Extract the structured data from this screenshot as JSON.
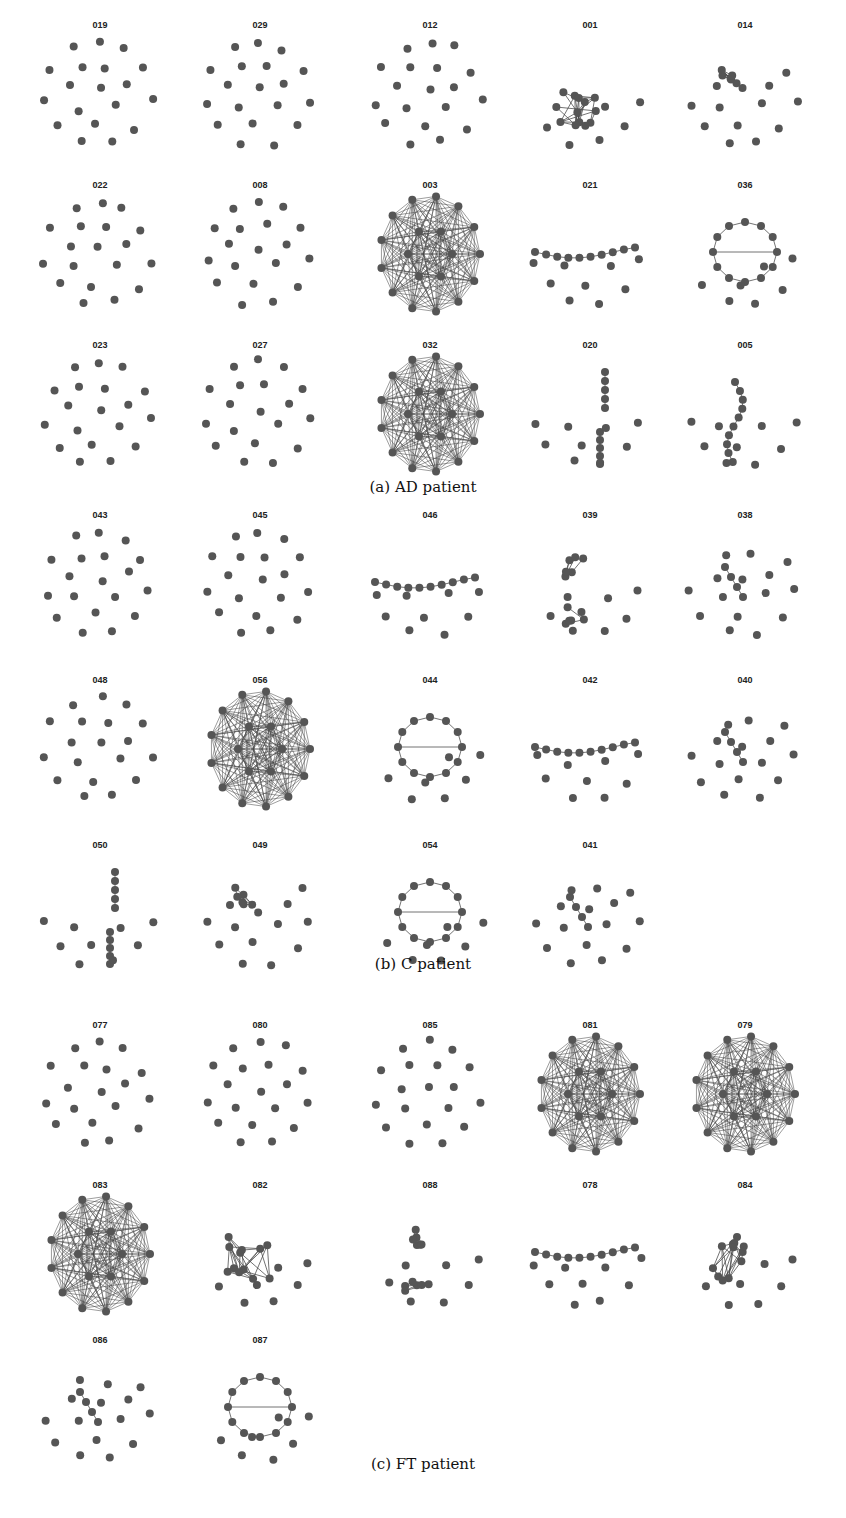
{
  "figure": {
    "node_color": "#555555",
    "edge_color": "#444444",
    "panels": [
      {
        "id": "a",
        "caption": "(a) AD patient",
        "graphs": [
          {
            "label": "019",
            "type": "sparse"
          },
          {
            "label": "029",
            "type": "sparse"
          },
          {
            "label": "012",
            "type": "sparse"
          },
          {
            "label": "001",
            "type": "cluster"
          },
          {
            "label": "014",
            "type": "small-cluster"
          },
          {
            "label": "022",
            "type": "sparse"
          },
          {
            "label": "008",
            "type": "sparse"
          },
          {
            "label": "003",
            "type": "dense"
          },
          {
            "label": "021",
            "type": "chain"
          },
          {
            "label": "036",
            "type": "loop"
          },
          {
            "label": "023",
            "type": "sparse"
          },
          {
            "label": "027",
            "type": "sparse"
          },
          {
            "label": "032",
            "type": "dense"
          },
          {
            "label": "020",
            "type": "two-chains"
          },
          {
            "label": "005",
            "type": "chain-vertical"
          }
        ]
      },
      {
        "id": "b",
        "caption": "(b) C patient",
        "graphs": [
          {
            "label": "043",
            "type": "sparse"
          },
          {
            "label": "045",
            "type": "sparse"
          },
          {
            "label": "046",
            "type": "chain"
          },
          {
            "label": "039",
            "type": "two-small"
          },
          {
            "label": "038",
            "type": "sparse-small"
          },
          {
            "label": "048",
            "type": "sparse"
          },
          {
            "label": "056",
            "type": "dense"
          },
          {
            "label": "044",
            "type": "loop"
          },
          {
            "label": "042",
            "type": "chain"
          },
          {
            "label": "040",
            "type": "chain-small"
          },
          {
            "label": "050",
            "type": "two-chains"
          },
          {
            "label": "049",
            "type": "small-cluster"
          },
          {
            "label": "054",
            "type": "loop"
          },
          {
            "label": "041",
            "type": "sparse-small"
          }
        ]
      },
      {
        "id": "c",
        "caption": "(c) FT patient",
        "graphs": [
          {
            "label": "077",
            "type": "sparse"
          },
          {
            "label": "080",
            "type": "sparse"
          },
          {
            "label": "085",
            "type": "sparse"
          },
          {
            "label": "081",
            "type": "dense"
          },
          {
            "label": "079",
            "type": "dense"
          },
          {
            "label": "083",
            "type": "dense"
          },
          {
            "label": "082",
            "type": "cluster"
          },
          {
            "label": "088",
            "type": "two-small"
          },
          {
            "label": "078",
            "type": "chain"
          },
          {
            "label": "084",
            "type": "cluster"
          },
          {
            "label": "086",
            "type": "sparse-small"
          },
          {
            "label": "087",
            "type": "loop"
          }
        ]
      }
    ]
  }
}
